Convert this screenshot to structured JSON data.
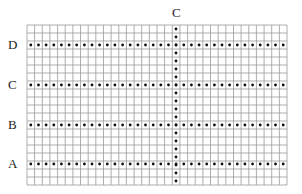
{
  "diagram": {
    "top_label": "C",
    "row_labels": [
      {
        "label": "D",
        "y": 45
      },
      {
        "label": "C",
        "y": 85
      },
      {
        "label": "B",
        "y": 125
      },
      {
        "label": "A",
        "y": 164
      }
    ],
    "grid": {
      "x0": 27,
      "x1": 287,
      "y0": 25,
      "y1": 185,
      "cols": 34,
      "rows": 20
    },
    "vertical_dot_column_x": 176,
    "colors": {
      "grid": "#9a9a9a",
      "dot": "#111111",
      "text": "#222222"
    }
  }
}
